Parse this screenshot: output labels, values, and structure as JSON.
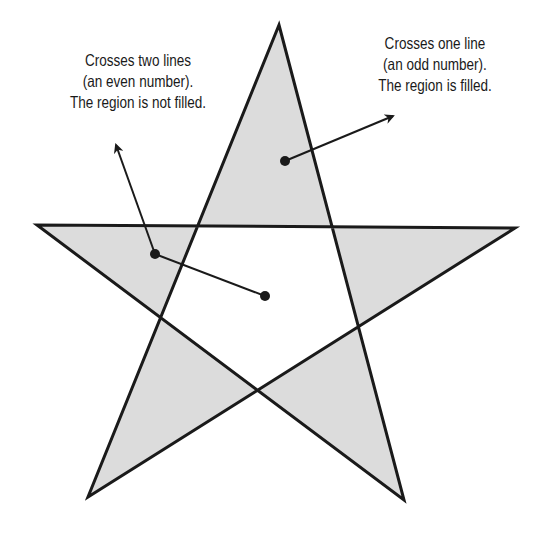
{
  "diagram": {
    "colors": {
      "fill": "#dcdcdc",
      "stroke": "#1a1a1a",
      "background": "#ffffff",
      "text": "#1a1a1a"
    },
    "star": {
      "vertices": [
        [
          279,
          25
        ],
        [
          404,
          500
        ],
        [
          37,
          225
        ],
        [
          515,
          228
        ],
        [
          88,
          497
        ]
      ],
      "stroke_width": 3
    },
    "annotations": [
      {
        "id": "left",
        "lines": [
          "Crosses two lines",
          "(an even number).",
          "The region is not filled."
        ],
        "dot_start": [
          265,
          296
        ],
        "dot_mid": [
          155,
          254
        ],
        "arrow_tip": [
          115,
          142
        ]
      },
      {
        "id": "right",
        "lines": [
          "Crosses one line",
          "(an odd number).",
          "The region is filled."
        ],
        "dot_start": [
          285,
          161
        ],
        "arrow_tip": [
          395,
          115
        ]
      }
    ]
  }
}
